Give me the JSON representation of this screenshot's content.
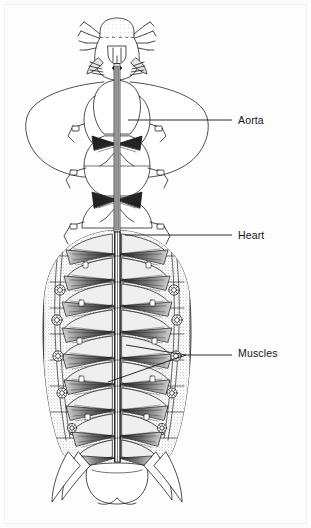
{
  "figure": {
    "background_color": "#fdfdfd",
    "ink_color": "#141414",
    "frame_color": "#f0f0f0",
    "width": 311,
    "height": 528
  },
  "labels": [
    {
      "id": "aorta",
      "text": "Aorta",
      "x": 238,
      "y": 115,
      "leader_from_x": 232,
      "leader_to_x": 128,
      "leader_y": 120
    },
    {
      "id": "heart",
      "text": "Heart",
      "x": 238,
      "y": 230,
      "leader_from_x": 232,
      "leader_to_x": 125,
      "leader_y": 235
    },
    {
      "id": "muscles",
      "text": "Muscles",
      "x": 238,
      "y": 348,
      "leader_from_x": 232,
      "leader_to_x": 150,
      "leader_y": 353
    }
  ],
  "anatomy": {
    "head": {
      "name": "head-capsule",
      "center_x": 117,
      "top_y": 20,
      "appendages": "antennae and mandibles"
    },
    "thorax": {
      "name": "thorax-with-wing-pads",
      "wing_pad_left_cx": 70,
      "wing_pad_right_cx": 164,
      "wing_pad_cy": 118,
      "segment_count": 3
    },
    "abdomen": {
      "name": "abdomen",
      "top_y": 232,
      "bottom_y": 460,
      "segment_count": 9,
      "spiracle_count_per_side": 5
    },
    "dorsal_vessel": {
      "name": "dorsal-vessel",
      "aorta_top_y": 62,
      "heart_top_y": 232,
      "heart_bottom_y": 455,
      "center_x": 117
    },
    "tail": {
      "name": "terminal-segment-and-cerci",
      "center_x": 117,
      "y": 478
    }
  }
}
